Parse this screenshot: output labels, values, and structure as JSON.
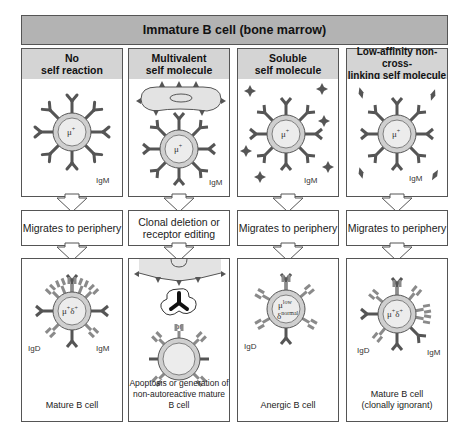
{
  "title": "Immature B cell (bone marrow)",
  "colors": {
    "title_bar": "#b3b3b3",
    "column_header": "#d4d4d4",
    "receptor": "#555555",
    "receptor_light": "#8a8a8a",
    "cell_fill": "#dcdcdc",
    "self_molecule": "#555555",
    "border": "#555555"
  },
  "columns": [
    {
      "header": "No\nself reaction",
      "top_panel": {
        "cell_label": "μ+",
        "receptor_label": "IgM",
        "self_molecule": "none"
      },
      "step": "Migrates to periphery",
      "bottom_panel": {
        "cell_label": "μ+δ+",
        "receptor_labels": [
          "IgD",
          "IgM"
        ],
        "caption": "Mature B cell"
      }
    },
    {
      "header": "Multivalent\nself molecule",
      "top_panel": {
        "cell_label": "μ+",
        "receptor_label": "IgM",
        "self_molecule": "multivalent cell-surface"
      },
      "step": "Clonal deletion or\nreceptor editing",
      "bottom_panel": {
        "separator": "or",
        "caption": "Apoptosis or generation of\nnon-autoreactive mature B cell"
      }
    },
    {
      "header": "Soluble\nself molecule",
      "top_panel": {
        "cell_label": "μ+",
        "receptor_label": "IgM",
        "self_molecule": "soluble"
      },
      "step": "Migrates to periphery",
      "bottom_panel": {
        "cell_label_top": "μlow",
        "cell_label_bottom": "δnormal",
        "receptor_labels": [
          "IgD"
        ],
        "caption": "Anergic B cell"
      }
    },
    {
      "header": "Low-affinity non-cross-\nlinking self molecule",
      "top_panel": {
        "cell_label": "μ+",
        "receptor_label": "IgM",
        "self_molecule": "low-affinity"
      },
      "step": "Migrates to periphery",
      "bottom_panel": {
        "cell_label": "μ+δ+",
        "receptor_labels": [
          "IgD",
          "IgM"
        ],
        "caption": "Mature B cell\n(clonally ignorant)"
      }
    }
  ],
  "sup": {
    "plus": "+",
    "low": "low",
    "normal": "normal",
    "mu": "μ",
    "delta": "δ"
  }
}
